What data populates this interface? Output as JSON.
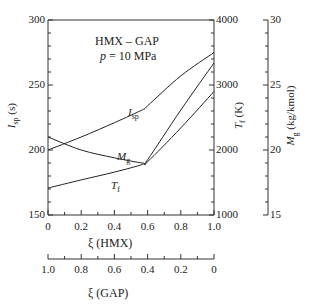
{
  "chart_data": {
    "type": "line",
    "title": "HMX – GAP",
    "subtitle": "p = 10 MPa",
    "xlabel": "ξ (HMX)",
    "xlabel_secondary": "ξ (GAP)",
    "xlim": [
      0,
      1.0
    ],
    "x_ticks": [
      "0",
      "0.2",
      "0.4",
      "0.6",
      "0.8",
      "1.0"
    ],
    "x_secondary_ticks": [
      "1.0",
      "0.8",
      "0.6",
      "0.4",
      "0.2",
      "0"
    ],
    "y_axes": [
      {
        "label": "Isp (s)",
        "position": "left",
        "range": [
          150,
          300
        ],
        "ticks": [
          "150",
          "200",
          "250",
          "300"
        ]
      },
      {
        "label": "Tf (K)",
        "position": "right",
        "range": [
          1000,
          4000
        ],
        "ticks": [
          "1000",
          "2000",
          "3000",
          "4000"
        ]
      },
      {
        "label": "Mg (kg/kmol)",
        "position": "far-right",
        "range": [
          15,
          30
        ],
        "ticks": [
          "15",
          "20",
          "25",
          "30"
        ]
      }
    ],
    "x": [
      0,
      0.2,
      0.4,
      0.57,
      0.6,
      0.8,
      1.0
    ],
    "series": [
      {
        "name": "Isp",
        "axis": "Isp (s)",
        "values": [
          200,
          210,
          221,
          231,
          234,
          257,
          275
        ]
      },
      {
        "name": "Tf",
        "axis": "Tf (K)",
        "values": [
          1415,
          1540,
          1660,
          1780,
          1850,
          2615,
          3340
        ]
      },
      {
        "name": "Mg",
        "axis": "Mg (kg/kmol)",
        "values": [
          21.0,
          20.0,
          19.4,
          19.0,
          19.1,
          21.7,
          24.5
        ]
      }
    ],
    "curve_labels": {
      "isp": "I",
      "isp_sub": "sp",
      "mg": "M",
      "mg_sub": "g",
      "tf": "T",
      "tf_sub": "f"
    },
    "grid": false,
    "legend": "none"
  },
  "labels": {
    "title_line1": "HMX – GAP",
    "title_line2_p": "p",
    "title_line2_rest": " = 10 MPa",
    "xlabel": "ξ (HMX)",
    "xlabel2": "ξ (GAP)",
    "y_left": "I",
    "y_left_sub": "sp",
    "y_left_unit": " (s)",
    "y_right": "T",
    "y_right_sub": "f",
    "y_right_unit": " (K)",
    "y_far": "M",
    "y_far_sub": "g",
    "y_far_unit": " (kg/kmol)"
  }
}
